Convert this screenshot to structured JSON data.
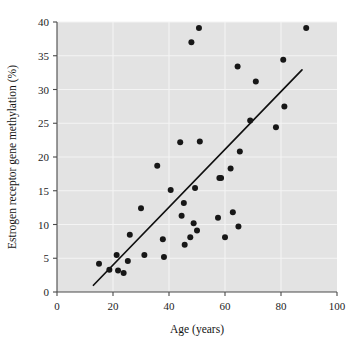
{
  "chart_data": {
    "type": "scatter",
    "title": "",
    "xlabel": "Age (years)",
    "ylabel": "Estrogen receptor gene methylation (%)",
    "xlim": [
      0,
      100
    ],
    "ylim": [
      0,
      40
    ],
    "xticks": [
      0,
      20,
      40,
      60,
      80,
      100
    ],
    "yticks": [
      0,
      5,
      10,
      15,
      20,
      25,
      30,
      35,
      40
    ],
    "grid": true,
    "grid_color": "#f4f4f4",
    "plot_background": "#e3e3e3",
    "point_color": "#171717",
    "line_color": "#101010",
    "legend": null,
    "series": [
      {
        "name": "Estrogen receptor gene methylation vs age",
        "marker": "filled-circle",
        "points": [
          [
            15.0,
            4.2
          ],
          [
            18.7,
            3.3
          ],
          [
            21.3,
            5.5
          ],
          [
            21.8,
            3.2
          ],
          [
            23.8,
            2.8
          ],
          [
            25.3,
            4.6
          ],
          [
            26.0,
            8.5
          ],
          [
            30.0,
            12.4
          ],
          [
            31.2,
            5.5
          ],
          [
            35.8,
            18.7
          ],
          [
            37.8,
            7.8
          ],
          [
            38.2,
            5.2
          ],
          [
            40.6,
            15.1
          ],
          [
            44.0,
            22.2
          ],
          [
            44.5,
            11.3
          ],
          [
            45.3,
            13.2
          ],
          [
            45.6,
            7.0
          ],
          [
            47.6,
            8.1
          ],
          [
            48.0,
            37.0
          ],
          [
            48.8,
            10.2
          ],
          [
            49.3,
            15.4
          ],
          [
            50.0,
            9.1
          ],
          [
            50.7,
            39.1
          ],
          [
            51.0,
            22.3
          ],
          [
            57.5,
            11.0
          ],
          [
            58.0,
            16.9
          ],
          [
            58.6,
            16.9
          ],
          [
            60.0,
            8.1
          ],
          [
            62.0,
            18.3
          ],
          [
            62.8,
            11.8
          ],
          [
            64.5,
            33.4
          ],
          [
            64.8,
            9.7
          ],
          [
            65.3,
            20.8
          ],
          [
            69.0,
            25.4
          ],
          [
            71.0,
            31.2
          ],
          [
            78.2,
            24.4
          ],
          [
            80.8,
            34.4
          ],
          [
            81.2,
            27.5
          ],
          [
            89.0,
            39.1
          ]
        ]
      }
    ],
    "trendline": {
      "type": "linear-fit",
      "x_start": 13.0,
      "y_start": 1.0,
      "x_end": 87.5,
      "y_end": 32.9
    }
  },
  "axes": {
    "x_tick_labels": [
      "0",
      "20",
      "40",
      "60",
      "80",
      "100"
    ],
    "y_tick_labels": [
      "0",
      "5",
      "10",
      "15",
      "20",
      "25",
      "30",
      "35",
      "40"
    ],
    "x_axis_title": "Age (years)",
    "y_axis_title": "Estrogen receptor gene methylation (%)"
  }
}
